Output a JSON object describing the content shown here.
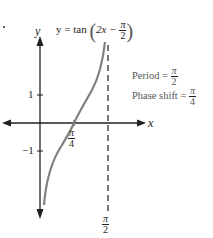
{
  "equation": {
    "lhs": "y = tan",
    "inner": "2x −",
    "inner_frac_num": "π",
    "inner_frac_den": "2",
    "open_paren": "(",
    "close_paren": ")"
  },
  "annotations": {
    "period_label": "Period =",
    "period_num": "π",
    "period_den": "2",
    "phase_label": "Phase shift =",
    "phase_num": "π",
    "phase_den": "4"
  },
  "axes": {
    "x_label": "x",
    "y_label": "y",
    "y_tick_pos": "1",
    "y_tick_neg": "−1",
    "x_tick_num": "π",
    "x_tick_den": "4",
    "asymptote_num": "π",
    "asymptote_den": "2"
  },
  "colors": {
    "axis": "#231f20",
    "curve": "#808080",
    "asymptote": "#231f20",
    "annotation_text": "#555555"
  }
}
